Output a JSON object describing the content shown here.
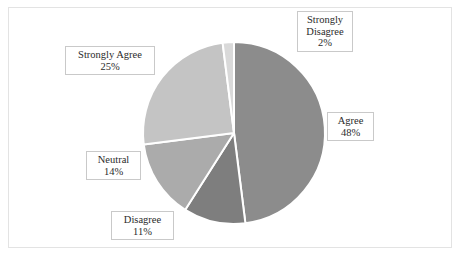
{
  "chart_data": {
    "type": "pie",
    "title": "",
    "subtitle": "",
    "xlabel": "",
    "ylabel": "",
    "grid": false,
    "legend_position": "none",
    "label_format": "category name with percentage",
    "start_angle_deg": 0,
    "direction": "clockwise",
    "categories": [
      "Agree",
      "Disagree",
      "Neutral",
      "Strongly Agree",
      "Strongly Disagree"
    ],
    "values": [
      48,
      11,
      14,
      25,
      2
    ],
    "units": "percent",
    "slices": [
      {
        "name": "Agree",
        "value": 48,
        "value_text": "48%",
        "color": "#8c8c8c",
        "label_line1": "Agree",
        "label_line2": "48%"
      },
      {
        "name": "Disagree",
        "value": 11,
        "value_text": "11%",
        "color": "#7e7e7e",
        "label_line1": "Disagree",
        "label_line2": "11%"
      },
      {
        "name": "Neutral",
        "value": 14,
        "value_text": "14%",
        "color": "#ababab",
        "label_line1": "Neutral",
        "label_line2": "14%"
      },
      {
        "name": "Strongly Agree",
        "value": 25,
        "value_text": "25%",
        "color": "#c4c4c4",
        "label_line1": "Strongly Agree",
        "label_line2": "25%"
      },
      {
        "name": "Strongly Disagree",
        "value": 2,
        "value_text": "2%",
        "color": "#d9d9d9",
        "label_line1": "Strongly",
        "label_line2": "Disagree",
        "label_line3": "2%"
      }
    ],
    "total": 100,
    "separator_color": "#ffffff",
    "frame_color": "#e3e3e3",
    "background_color": "#ffffff",
    "label_text_color": "#2b2b2b",
    "label_box_border_color": "#c9c9c9"
  },
  "geometry": {
    "center_x": 234,
    "center_y": 133,
    "radius": 91
  }
}
